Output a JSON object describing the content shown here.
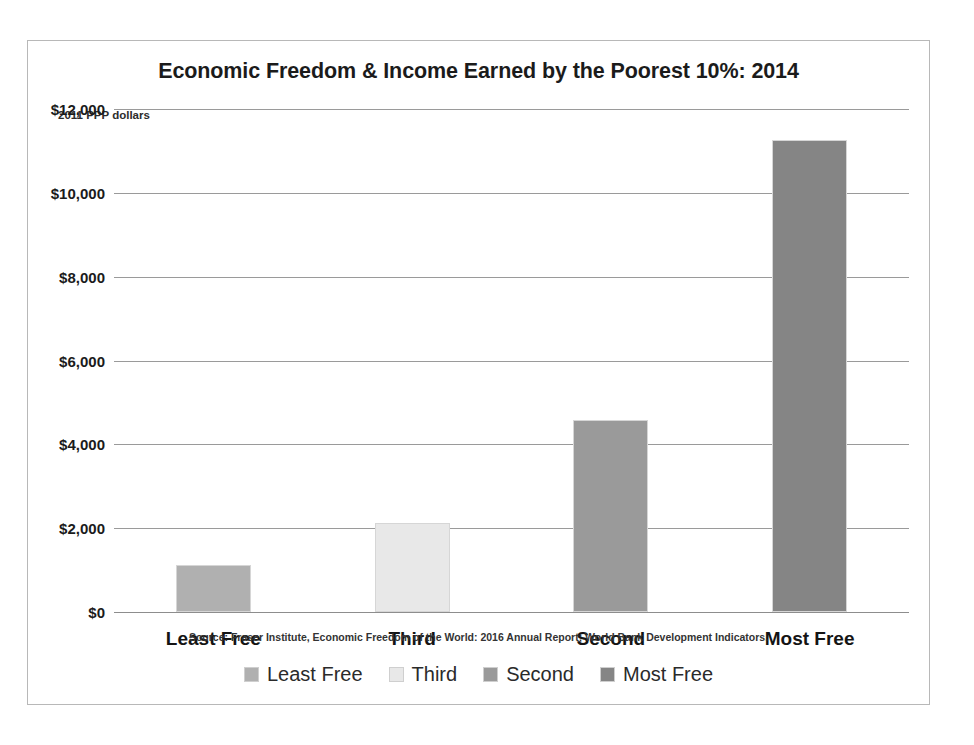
{
  "chart_data": {
    "type": "bar",
    "title": "Economic Freedom & Income Earned by the Poorest 10%: 2014",
    "unit_label": "2011 PPP dollars",
    "categories": [
      "Least Free",
      "Third",
      "Second",
      "Most Free"
    ],
    "values": [
      1110,
      2130,
      4580,
      11270
    ],
    "series": [
      {
        "name": "Income Earned by the Poorest 10%",
        "values": [
          1110,
          2130,
          4580,
          11270
        ]
      }
    ],
    "bar_colors": [
      "#b0b0b0",
      "#e8e8e8",
      "#9a9a9a",
      "#858585"
    ],
    "xlabel": "",
    "ylabel": "2011 PPP dollars",
    "ylim": [
      0,
      12000
    ],
    "ytick_values": [
      12000,
      10000,
      8000,
      6000,
      4000,
      2000,
      0
    ],
    "ytick_labels": [
      "$12,000",
      "$10,000",
      "$8,000",
      "$6,000",
      "$4,000",
      "$2,000",
      "$0"
    ],
    "grid": true,
    "legend_position": "bottom",
    "legend": [
      {
        "label": "Least Free",
        "color": "#b0b0b0"
      },
      {
        "label": "Third",
        "color": "#e8e8e8"
      },
      {
        "label": "Second",
        "color": "#9a9a9a"
      },
      {
        "label": "Most Free",
        "color": "#858585"
      }
    ],
    "source_note": "Source: Fraser Institute, Economic Freedom of the World: 2016 Annual Report; World Bank Development Indicators."
  }
}
